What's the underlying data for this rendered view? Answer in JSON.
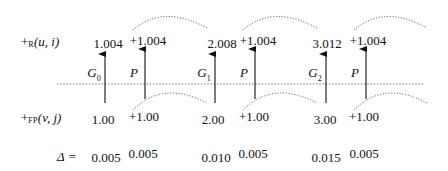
{
  "row_labels": {
    "top": {
      "prefix": "+",
      "sub": "R",
      "args": "(u, i)"
    },
    "bottom": {
      "prefix": "+",
      "sub": "FP",
      "args": "(v, j)"
    },
    "delta": "Δ ="
  },
  "arrow_labels": [
    {
      "name": "G",
      "sub": "0"
    },
    {
      "name": "P",
      "sub": ""
    },
    {
      "name": "G",
      "sub": "1"
    },
    {
      "name": "P",
      "sub": ""
    },
    {
      "name": "G",
      "sub": "2"
    },
    {
      "name": "P",
      "sub": ""
    }
  ],
  "top_values": [
    "1.004",
    "+1.004",
    "2.008",
    "+1.004",
    "3.012",
    "+1.004"
  ],
  "bottom_values": [
    "1.00",
    "+1.00",
    "2.00",
    "+1.00",
    "3.00",
    "+1.00"
  ],
  "delta_values": [
    "0.005",
    "0.005",
    "0.010",
    "0.005",
    "0.015",
    "0.005"
  ],
  "colors": {
    "ink": "#111111",
    "dotted": "#555555"
  }
}
